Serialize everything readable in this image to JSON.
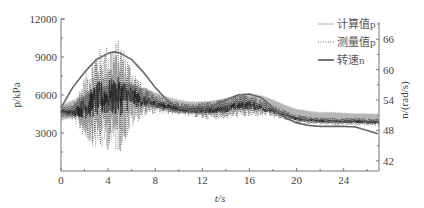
{
  "chart_data": {
    "type": "line",
    "title": "",
    "xlabel": "t/s",
    "ylabel_left": "p/kPa",
    "ylabel_right": "n/(rad/s)",
    "xlim": [
      0,
      27
    ],
    "ylim_left": [
      0,
      12000
    ],
    "ylim_right": [
      40,
      70
    ],
    "x_ticks": [
      0,
      4,
      8,
      12,
      16,
      20,
      24
    ],
    "x_minor_ticks": [
      2,
      6,
      10,
      14,
      18,
      22,
      26
    ],
    "y_left_ticks": [
      3000,
      6000,
      9000,
      12000
    ],
    "y_right_ticks": [
      42,
      48,
      54,
      60,
      66
    ],
    "grid": false,
    "legend_position": "upper right",
    "legend": [
      {
        "label": "计算值p",
        "style": "thin-solid",
        "color": "#999999"
      },
      {
        "label": "测量值p",
        "style": "dotted",
        "color": "#555555"
      },
      {
        "label": "转速n",
        "style": "thick-solid",
        "color": "#666666"
      }
    ],
    "series": [
      {
        "name": "转速n",
        "axis": "right",
        "color": "#666666",
        "x": [
          0,
          1,
          2,
          3,
          4,
          4.5,
          5,
          6,
          7,
          8,
          9,
          10,
          11,
          12,
          13,
          14,
          15,
          16,
          17,
          18,
          19,
          20,
          21,
          22,
          23,
          24,
          25,
          26,
          27
        ],
        "values": [
          52.5,
          56.5,
          59.5,
          62,
          63.2,
          63.5,
          63.3,
          62,
          59.5,
          56.5,
          54,
          52.5,
          52,
          52.2,
          53,
          54,
          55,
          55.2,
          54.5,
          52.5,
          50.5,
          49.5,
          49,
          48.8,
          48.8,
          48.8,
          48.7,
          48,
          47.3
        ]
      },
      {
        "name": "计算值p",
        "axis": "left",
        "color": "#999999",
        "x": [
          0,
          1,
          2,
          3,
          4,
          5,
          6,
          7,
          8,
          9,
          10,
          11,
          12,
          13,
          14,
          15,
          16,
          17,
          18,
          19,
          20,
          21,
          22,
          23,
          24,
          25,
          26,
          27
        ],
        "center": [
          4600,
          4900,
          5300,
          5800,
          6100,
          6300,
          6200,
          5900,
          5600,
          5300,
          5100,
          5000,
          5000,
          5100,
          5300,
          5500,
          5600,
          5500,
          5200,
          4800,
          4500,
          4400,
          4300,
          4300,
          4250,
          4200,
          4200,
          4150
        ],
        "band": [
          700,
          800,
          800,
          800,
          800,
          800,
          800,
          750,
          700,
          650,
          600,
          550,
          550,
          550,
          550,
          550,
          550,
          550,
          500,
          500,
          450,
          400,
          400,
          400,
          400,
          400,
          400,
          400
        ]
      },
      {
        "name": "测量值p",
        "axis": "left",
        "color": "#222222",
        "x": [
          0,
          1,
          2,
          3,
          4,
          5,
          6,
          7,
          8,
          9,
          10,
          11,
          12,
          13,
          14,
          15,
          16,
          17,
          18,
          19,
          20,
          21,
          22,
          23,
          24,
          25,
          26,
          27
        ],
        "center": [
          4700,
          4600,
          5000,
          5600,
          5800,
          5900,
          5800,
          5500,
          5300,
          5100,
          4900,
          4800,
          4800,
          4800,
          4900,
          5100,
          5200,
          5000,
          4700,
          4400,
          4100,
          4000,
          3950,
          3900,
          3900,
          3900,
          3850,
          3850
        ],
        "amplitude": [
          400,
          600,
          2500,
          4000,
          4200,
          4500,
          2500,
          1200,
          800,
          600,
          500,
          500,
          700,
          700,
          800,
          900,
          1000,
          700,
          500,
          400,
          350,
          300,
          300,
          300,
          300,
          300,
          300,
          300
        ],
        "peak_max": 11300,
        "peak_min": 1000
      }
    ]
  },
  "plot": {
    "left": 61,
    "right": 379,
    "top": 19,
    "bottom": 171
  }
}
